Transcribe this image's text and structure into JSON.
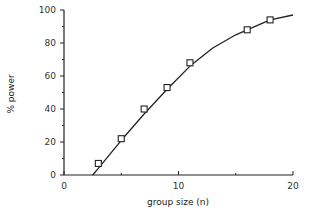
{
  "chart_data": {
    "type": "scatter",
    "title": "",
    "xlabel": "group size (n)",
    "ylabel": "% power",
    "xlim": [
      0,
      20
    ],
    "ylim": [
      0,
      100
    ],
    "xticks": [
      0,
      10,
      20
    ],
    "xminor": [
      5,
      15
    ],
    "yticks": [
      0,
      20,
      40,
      60,
      80,
      100
    ],
    "yminor": [
      10,
      30,
      50,
      70,
      90
    ],
    "grid": false,
    "legend": null,
    "series": [
      {
        "name": "observed power",
        "marker": "square",
        "x": [
          3,
          5,
          7,
          9,
          11,
          16,
          18
        ],
        "y": [
          7,
          22,
          40,
          53,
          68,
          88,
          94
        ]
      },
      {
        "name": "fitted curve",
        "style": "line",
        "x": [
          2.5,
          3,
          5,
          7,
          9,
          11,
          13,
          15,
          16,
          18,
          20
        ],
        "y": [
          0,
          4,
          21,
          37,
          52,
          66,
          77,
          85,
          88,
          94,
          97
        ]
      }
    ]
  },
  "colors": {
    "line": "#222222",
    "axis": "#222222",
    "marker_fill": "#ffffff"
  }
}
